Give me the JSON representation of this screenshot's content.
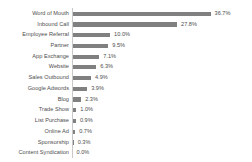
{
  "chart_data": {
    "type": "bar",
    "orientation": "horizontal",
    "title": "",
    "subtitle": "",
    "xlabel": "",
    "ylabel": "",
    "grid": false,
    "legend": null,
    "xlim": [
      0,
      36.7
    ],
    "value_suffix": "%",
    "bar_color": "#808080",
    "axis_color": "#c9c9c9",
    "text_color": "#4d4d4d",
    "background": "#ffffff",
    "categories": [
      "Word of Mouth",
      "Inbound Call",
      "Employee Referral",
      "Partner",
      "App Exchange",
      "Website",
      "Sales Outbound",
      "Google Adwords",
      "Blog",
      "Trade Show",
      "List Purchase",
      "Online Ad",
      "Sponsorship",
      "Content Syndication"
    ],
    "values": [
      36.7,
      27.8,
      10.0,
      9.5,
      7.1,
      6.3,
      4.9,
      3.9,
      2.3,
      1.0,
      0.9,
      0.7,
      0.3,
      0.0
    ],
    "value_labels": [
      "36.7%",
      "27.8%",
      "10.0%",
      "9.5%",
      "7.1%",
      "6.3%",
      "4.9%",
      "3.9%",
      "2.3%",
      "1.0%",
      "0.9%",
      "0.7%",
      "0.3%",
      "0.0%"
    ]
  },
  "top_crop_artifact": "· · ·"
}
